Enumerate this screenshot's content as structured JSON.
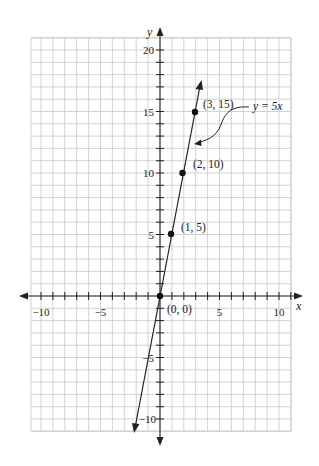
{
  "chart_data": {
    "type": "line",
    "title": "",
    "xlabel": "x",
    "ylabel": "y",
    "xlim": [
      -10,
      10
    ],
    "ylim": [
      -10,
      20
    ],
    "grid": true,
    "x_ticks": [
      -10,
      -5,
      5,
      10
    ],
    "x_tick_labels": [
      "−10",
      "−5",
      "5",
      "10"
    ],
    "y_ticks": [
      -10,
      -5,
      5,
      10,
      15,
      20
    ],
    "y_tick_labels": [
      "−10",
      "−5",
      "5",
      "10",
      "15",
      "20"
    ],
    "series": [
      {
        "name": "y = 5x",
        "equation": "y = 5x",
        "slope": 5,
        "intercept": 0,
        "points": [
          {
            "x": 0,
            "y": 0,
            "label": "(0, 0)"
          },
          {
            "x": 1,
            "y": 5,
            "label": "(1, 5)"
          },
          {
            "x": 2,
            "y": 10,
            "label": "(2, 10)"
          },
          {
            "x": 3,
            "y": 15,
            "label": "(3, 15)"
          }
        ]
      }
    ],
    "annotations": [
      {
        "text": "y = 5x",
        "points_to": "line"
      }
    ]
  },
  "labels": {
    "x_axis": "x",
    "y_axis": "y",
    "equation": "y = 5x",
    "p0": "(0, 0)",
    "p1": "(1, 5)",
    "p2": "(2, 10)",
    "p3": "(3, 15)",
    "xt_m10": "−10",
    "xt_m5": "−5",
    "xt_5": "5",
    "xt_10": "10",
    "yt_20": "20",
    "yt_15": "15",
    "yt_10": "10",
    "yt_5": "5",
    "yt_m5": "−5",
    "yt_m10": "−10"
  },
  "colors": {
    "grid": "#c8c8c8",
    "axis": "#222222",
    "line": "#222222",
    "background": "#ffffff"
  }
}
